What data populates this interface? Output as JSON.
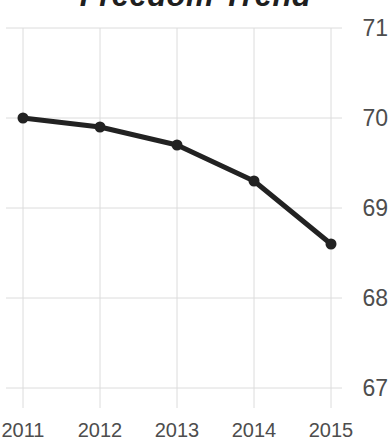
{
  "title": "Freedom Trend",
  "colors": {
    "line": "#222222",
    "point": "#222222",
    "grid": "#dcdcdc",
    "axis_label": "#4d4d4d",
    "title": "#1f1f1f",
    "background": "#ffffff"
  },
  "chart_data": {
    "type": "line",
    "title": "Freedom Trend",
    "categories": [
      "2011",
      "2012",
      "2013",
      "2014",
      "2015"
    ],
    "values": [
      70.0,
      69.9,
      69.7,
      69.3,
      68.6
    ],
    "xlabel": "",
    "ylabel": "",
    "ylim": [
      67,
      71
    ],
    "yticks": [
      67,
      68,
      69,
      70,
      71
    ],
    "y_axis_side": "right",
    "grid": true,
    "legend": "none"
  }
}
